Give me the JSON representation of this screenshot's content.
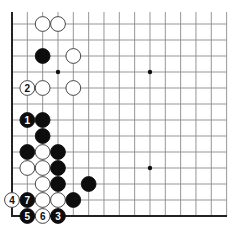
{
  "diagram": {
    "type": "go-board-corner",
    "corner": "bottom-left",
    "grid": {
      "origin_x": 12,
      "origin_y": 216,
      "dx": 15.33,
      "dy": 16,
      "cols": 15,
      "rows": 13,
      "line_color": "#8a8a8a",
      "edge_color": "#222222"
    },
    "star_points": [
      {
        "col": 3,
        "row": 9
      },
      {
        "col": 9,
        "row": 9
      },
      {
        "col": 9,
        "row": 3
      }
    ],
    "stones": [
      {
        "color": "white",
        "col": 2,
        "row": 12,
        "label": ""
      },
      {
        "color": "white",
        "col": 3,
        "row": 12,
        "label": ""
      },
      {
        "color": "black",
        "col": 2,
        "row": 10,
        "label": ""
      },
      {
        "color": "white",
        "col": 4,
        "row": 10,
        "label": ""
      },
      {
        "color": "white",
        "col": 1,
        "row": 8,
        "label": "2"
      },
      {
        "color": "white",
        "col": 2,
        "row": 8,
        "label": ""
      },
      {
        "color": "white",
        "col": 4,
        "row": 8,
        "label": ""
      },
      {
        "color": "black",
        "col": 1,
        "row": 6,
        "label": "1"
      },
      {
        "color": "black",
        "col": 2,
        "row": 6,
        "label": ""
      },
      {
        "color": "black",
        "col": 2,
        "row": 5,
        "label": ""
      },
      {
        "color": "black",
        "col": 1,
        "row": 4,
        "label": ""
      },
      {
        "color": "white",
        "col": 2,
        "row": 4,
        "label": ""
      },
      {
        "color": "black",
        "col": 3,
        "row": 4,
        "label": ""
      },
      {
        "color": "white",
        "col": 1,
        "row": 3,
        "label": ""
      },
      {
        "color": "white",
        "col": 2,
        "row": 3,
        "label": ""
      },
      {
        "color": "black",
        "col": 3,
        "row": 3,
        "label": ""
      },
      {
        "color": "white",
        "col": 2,
        "row": 2,
        "label": ""
      },
      {
        "color": "black",
        "col": 3,
        "row": 2,
        "label": ""
      },
      {
        "color": "black",
        "col": 5,
        "row": 2,
        "label": ""
      },
      {
        "color": "white",
        "col": 0,
        "row": 1,
        "label": "4"
      },
      {
        "color": "black",
        "col": 1,
        "row": 1,
        "label": "7"
      },
      {
        "color": "white",
        "col": 2,
        "row": 1,
        "label": ""
      },
      {
        "color": "white",
        "col": 3,
        "row": 1,
        "label": ""
      },
      {
        "color": "black",
        "col": 4,
        "row": 1,
        "label": ""
      },
      {
        "color": "black",
        "col": 1,
        "row": 0,
        "label": "5"
      },
      {
        "color": "white",
        "col": 2,
        "row": 0,
        "label": "6"
      },
      {
        "color": "black",
        "col": 3,
        "row": 0,
        "label": "3"
      }
    ]
  }
}
